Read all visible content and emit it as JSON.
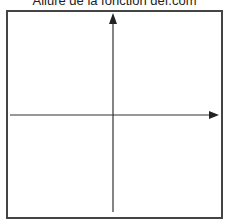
{
  "figure": {
    "title": "Allure de la fonction def.com",
    "frame_color": "#444444",
    "axis_color": "#333333"
  },
  "axes": {
    "x_axis": {
      "label": "",
      "direction": "right"
    },
    "y_axis": {
      "label": "",
      "direction": "up"
    },
    "origin": {
      "x_px": 113,
      "y_px": 115
    }
  }
}
